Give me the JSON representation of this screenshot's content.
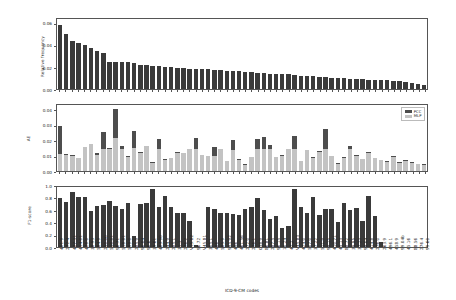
{
  "figure": {
    "xlabel": "ICD-9-CM codes",
    "background": "#ffffff",
    "colors": {
      "pcc": "#4d4d4d",
      "mlp": "#c3c3c3",
      "freq": "#3a3a3a",
      "f1": "#3a3a3a",
      "axis": "#555555"
    }
  },
  "legend": {
    "position": "top-right",
    "entries": [
      {
        "label": "PCC",
        "color": "#4d4d4d"
      },
      {
        "label": "MLP",
        "color": "#c3c3c3"
      }
    ]
  },
  "chart_data": [
    {
      "type": "bar",
      "title": "",
      "xlabel": "",
      "ylabel": "Relative frequency",
      "ylim": [
        0.0,
        0.065
      ],
      "yticks": [
        0.0,
        0.02,
        0.04,
        0.06
      ],
      "ytick_labels": [
        "0.00",
        "0.02",
        "0.04",
        "0.06"
      ],
      "grid": false,
      "categories": [
        "401.9",
        "272.4",
        "427.31",
        "414.01",
        "428.0",
        "38.93",
        "584.9",
        "250.00",
        "530.81",
        "96.71",
        "518.81",
        "599.0",
        "285.9",
        "96.04",
        "96.6",
        "39.61",
        "403.90",
        "244.9",
        "285.1",
        "31.1",
        "276.2",
        "V15.82",
        "96.72",
        "V45.81",
        "305.1",
        "486",
        "585.9",
        "995.92",
        "496",
        "461.56",
        "272.0",
        "276.1",
        "038.9",
        "86.81",
        "287.5",
        "96.15",
        "10.24",
        "42.2",
        "V45.83",
        "424.0",
        "507.0",
        "37.22",
        "511.9",
        "99.15",
        "410.71",
        "45.13",
        "88.72",
        "39.95",
        "37.23",
        "99.04",
        "414.8",
        "276.0",
        "263.9",
        "496.1",
        "458.9",
        "99.04b",
        "45.16",
        "88.56",
        "276.4",
        "99.60"
      ],
      "values": [
        0.0595,
        0.051,
        0.045,
        0.0425,
        0.0405,
        0.038,
        0.0355,
        0.033,
        0.0255,
        0.0252,
        0.025,
        0.0248,
        0.0243,
        0.0225,
        0.0222,
        0.0218,
        0.0215,
        0.0202,
        0.02,
        0.0195,
        0.0192,
        0.019,
        0.0188,
        0.0185,
        0.0182,
        0.018,
        0.0172,
        0.017,
        0.0168,
        0.0165,
        0.016,
        0.0155,
        0.015,
        0.0145,
        0.0142,
        0.014,
        0.0138,
        0.0135,
        0.0128,
        0.0125,
        0.0122,
        0.012,
        0.0112,
        0.0108,
        0.0105,
        0.01,
        0.0098,
        0.0095,
        0.0092,
        0.009,
        0.0088,
        0.0085,
        0.0082,
        0.008,
        0.0078,
        0.0072,
        0.0062,
        0.0055,
        0.0048,
        0.004
      ]
    },
    {
      "type": "bar",
      "title": "",
      "xlabel": "",
      "ylabel": "AE",
      "ylim": [
        0.0,
        0.044
      ],
      "yticks": [
        0.0,
        0.01,
        0.02,
        0.03,
        0.04
      ],
      "ytick_labels": [
        "0.00",
        "0.01",
        "0.02",
        "0.03",
        "0.04"
      ],
      "grid": false,
      "overlap": true,
      "categories": [
        "401.9",
        "272.4",
        "427.31",
        "414.01",
        "428.0",
        "38.93",
        "584.9",
        "250.00",
        "530.81",
        "96.71",
        "518.81",
        "599.0",
        "285.9",
        "96.04",
        "96.6",
        "39.61",
        "403.90",
        "244.9",
        "285.1",
        "31.1",
        "276.2",
        "V15.82",
        "96.72",
        "V45.81",
        "305.1",
        "486",
        "585.9",
        "995.92",
        "496",
        "461.56",
        "272.0",
        "276.1",
        "038.9",
        "86.81",
        "287.5",
        "96.15",
        "10.24",
        "42.2",
        "V45.83",
        "424.0",
        "507.0",
        "37.22",
        "511.9",
        "99.15",
        "410.71",
        "45.13",
        "88.72",
        "39.95",
        "37.23",
        "99.04",
        "414.8",
        "276.0",
        "263.9",
        "496.1",
        "458.9",
        "99.04b",
        "45.16",
        "88.56",
        "276.4",
        "99.60"
      ],
      "series": [
        {
          "name": "PCC",
          "color": "#4d4d4d",
          "values": [
            0.03,
            0.0113,
            0.0108,
            0.009,
            0.0162,
            0.0178,
            0.012,
            0.0262,
            0.0152,
            0.0413,
            0.0168,
            0.0098,
            0.0268,
            0.0125,
            0.0168,
            0.0058,
            0.0212,
            0.0078,
            0.009,
            0.013,
            0.012,
            0.0148,
            0.0222,
            0.011,
            0.0103,
            0.0157,
            0.015,
            0.007,
            0.0205,
            0.0078,
            0.0045,
            0.0096,
            0.0212,
            0.0225,
            0.0175,
            0.0095,
            0.011,
            0.015,
            0.0235,
            0.0068,
            0.0142,
            0.0095,
            0.0133,
            0.028,
            0.01,
            0.0052,
            0.0092,
            0.0168,
            0.0105,
            0.0082,
            0.0128,
            0.009,
            0.0076,
            0.0065,
            0.01,
            0.0058,
            0.0072,
            0.006,
            0.005,
            0.0044
          ]
        },
        {
          "name": "MLP",
          "color": "#c3c3c3",
          "values": [
            0.0112,
            0.0108,
            0.01,
            0.0088,
            0.016,
            0.0178,
            0.011,
            0.015,
            0.015,
            0.0222,
            0.015,
            0.0094,
            0.0152,
            0.0122,
            0.0168,
            0.0056,
            0.0148,
            0.0076,
            0.0086,
            0.012,
            0.0118,
            0.0148,
            0.015,
            0.0106,
            0.01,
            0.0098,
            0.0148,
            0.0068,
            0.0142,
            0.0074,
            0.0042,
            0.0092,
            0.015,
            0.015,
            0.015,
            0.0092,
            0.0102,
            0.015,
            0.015,
            0.0064,
            0.014,
            0.009,
            0.013,
            0.015,
            0.0098,
            0.005,
            0.0088,
            0.015,
            0.01,
            0.0078,
            0.012,
            0.0086,
            0.0072,
            0.0062,
            0.0096,
            0.0054,
            0.0068,
            0.0056,
            0.0046,
            0.004
          ]
        }
      ]
    },
    {
      "type": "bar",
      "title": "",
      "xlabel": "ICD-9-CM codes",
      "ylabel": "F1-score",
      "ylim": [
        0.0,
        1.0
      ],
      "yticks": [
        0.0,
        0.2,
        0.4,
        0.6,
        0.8,
        1.0
      ],
      "ytick_labels": [
        "0.0",
        "0.2",
        "0.4",
        "0.6",
        "0.8",
        "1.0"
      ],
      "grid": false,
      "categories": [
        "401.9",
        "272.4",
        "427.31",
        "414.01",
        "428.0",
        "38.93",
        "584.9",
        "250.00",
        "530.81",
        "96.71",
        "518.81",
        "599.0",
        "285.9",
        "96.04",
        "96.6",
        "39.61",
        "403.90",
        "244.9",
        "285.1",
        "31.1",
        "276.2",
        "V15.82",
        "96.72",
        "V45.81",
        "305.1",
        "486",
        "585.9",
        "995.92",
        "496",
        "461.56",
        "272.0",
        "276.1",
        "038.9",
        "86.81",
        "287.5",
        "96.15",
        "10.24",
        "42.2",
        "V45.83",
        "424.0",
        "507.0",
        "37.22",
        "511.9",
        "99.15",
        "410.71",
        "45.13",
        "88.72",
        "39.95",
        "37.23",
        "99.04",
        "414.8",
        "276.0",
        "263.9",
        "496.1",
        "458.9",
        "99.04b",
        "45.16",
        "88.56",
        "276.4",
        "99.60"
      ],
      "values": [
        0.82,
        0.75,
        0.91,
        0.83,
        0.83,
        0.6,
        0.68,
        0.7,
        0.77,
        0.69,
        0.63,
        0.73,
        0.19,
        0.71,
        0.73,
        0.96,
        0.66,
        0.85,
        0.67,
        0.57,
        0.57,
        0.43,
        0.03,
        0.0,
        0.66,
        0.64,
        0.57,
        0.56,
        0.55,
        0.54,
        0.64,
        0.66,
        0.82,
        0.62,
        0.46,
        0.51,
        0.31,
        0.35,
        0.96,
        0.66,
        0.56,
        0.83,
        0.54,
        0.63,
        0.63,
        0.42,
        0.74,
        0.61,
        0.65,
        0.44,
        0.85,
        0.52,
        0.08,
        0.0,
        0.0,
        0.0,
        0.0,
        0.0,
        0.0,
        0.0
      ]
    }
  ]
}
